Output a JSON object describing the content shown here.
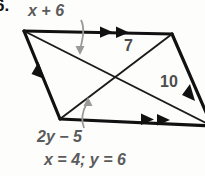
{
  "figure": {
    "type": "geometry-parallelogram-diagram",
    "item_number": "6.",
    "colors": {
      "outline": "#111111",
      "diagonal": "#1a1a1a",
      "label": "#5b5b5b",
      "pointer_arrow": "#8c8c8c",
      "background": "#fdfdfc"
    },
    "labels": {
      "top_side": "x + 6",
      "upper_right_segment": "7",
      "right_segment": "10",
      "bottom_side": "2y − 5",
      "answer": "x = 4; y = 6"
    },
    "tick_marks": {
      "top_side": "double-arrowhead",
      "bottom_side": "double-arrowhead",
      "left_side": "single-arrowhead",
      "right_side": "single-arrowhead"
    },
    "geometry": {
      "vertices": {
        "top_left": [
          24,
          31
        ],
        "top_right": [
          172,
          34
        ],
        "bottom_right": [
          209,
          124
        ],
        "bottom_left": [
          60,
          119
        ]
      },
      "diagonal_intersection": [
        116,
        78
      ]
    }
  }
}
